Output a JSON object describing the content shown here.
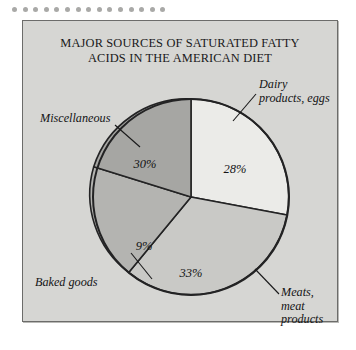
{
  "decoration": {
    "dot_count": 15,
    "dot_color": "#a9a9a7"
  },
  "figure": {
    "background_color": "#d6d6d3",
    "border_color": "#6c6c6a"
  },
  "chart_data": {
    "type": "pie",
    "title": "MAJOR SOURCES OF SATURATED FATTY\nACIDS IN THE AMERICAN DIET",
    "subtitle": "",
    "xlabel": "",
    "ylabel": "",
    "legend_position": "callout-labels",
    "grid": false,
    "units": "percent",
    "total": 100,
    "categories": [
      "Dairy products, eggs",
      "Meats, meat products",
      "Baked goods",
      "Miscellaneous"
    ],
    "values": [
      28,
      33,
      9,
      30
    ],
    "value_labels": [
      "28%",
      "33%",
      "9%",
      "30%"
    ],
    "slice_colors": [
      "#ebebe8",
      "#c9c9c6",
      "#b4b4b1",
      "#a6a6a3"
    ],
    "slices": [
      {
        "name": "Dairy products, eggs",
        "label": "Dairy\nproducts, eggs",
        "value": 28,
        "value_label": "28%",
        "color": "#ebebe8"
      },
      {
        "name": "Meats, meat products",
        "label": "Meats,\nmeat products",
        "value": 33,
        "value_label": "33%",
        "color": "#c9c9c6"
      },
      {
        "name": "Baked goods",
        "label": "Baked goods",
        "value": 9,
        "value_label": "9%",
        "color": "#b4b4b1"
      },
      {
        "name": "Miscellaneous",
        "label": "Miscellaneous",
        "value": 30,
        "value_label": "30%",
        "color": "#a6a6a3"
      }
    ]
  }
}
